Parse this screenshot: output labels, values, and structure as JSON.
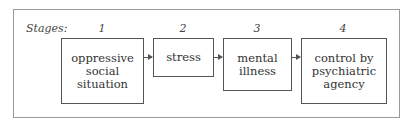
{
  "diagram": {
    "stages_label": "Stages:",
    "stages": [
      {
        "number": "1",
        "label": "oppressive\nsocial\nsituation"
      },
      {
        "number": "2",
        "label": "stress"
      },
      {
        "number": "3",
        "label": "mental\nillness"
      },
      {
        "number": "4",
        "label": "control by\npsychiatric\nagency"
      }
    ],
    "arrows": [
      {
        "from": "1",
        "to": "2"
      },
      {
        "from": "2",
        "to": "3"
      },
      {
        "from": "3",
        "to": "4"
      }
    ]
  }
}
